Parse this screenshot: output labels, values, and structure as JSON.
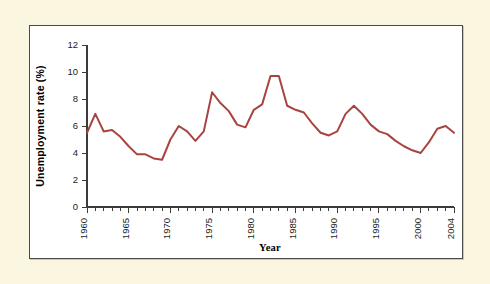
{
  "figure": {
    "background_color": "#fbf6e0",
    "panel_color": "#ffffff",
    "border_color": "#4a4a46"
  },
  "chart_data": {
    "type": "line",
    "title": "",
    "xlabel": "Year",
    "ylabel": "Unemployment rate (%)",
    "xlim": [
      1960,
      2004
    ],
    "ylim": [
      0,
      12
    ],
    "grid": false,
    "legend": "none",
    "line_color": "#a8443f",
    "xticks": [
      1960,
      1965,
      1970,
      1975,
      1980,
      1985,
      1990,
      1995,
      2000,
      2004
    ],
    "xtick_labels": [
      "1960",
      "1965",
      "1970",
      "1975",
      "1980",
      "1985",
      "1990",
      "1995",
      "2000",
      "2004"
    ],
    "xtick_minor": [
      1961,
      1962,
      1963,
      1964,
      1966,
      1967,
      1968,
      1969,
      1971,
      1972,
      1973,
      1974,
      1976,
      1977,
      1978,
      1979,
      1981,
      1982,
      1983,
      1984,
      1986,
      1987,
      1988,
      1989,
      1991,
      1992,
      1993,
      1994,
      1996,
      1997,
      1998,
      1999,
      2001,
      2002,
      2003
    ],
    "yticks": [
      0,
      2,
      4,
      6,
      8,
      10,
      12
    ],
    "ytick_labels": [
      "0",
      "2",
      "4",
      "6",
      "8",
      "10",
      "12"
    ],
    "x": [
      1960,
      1961,
      1962,
      1963,
      1964,
      1965,
      1966,
      1967,
      1968,
      1969,
      1970,
      1971,
      1972,
      1973,
      1974,
      1975,
      1976,
      1977,
      1978,
      1979,
      1980,
      1981,
      1982,
      1983,
      1984,
      1985,
      1986,
      1987,
      1988,
      1989,
      1990,
      1991,
      1992,
      1993,
      1994,
      1995,
      1996,
      1997,
      1998,
      1999,
      2000,
      2001,
      2002,
      2003,
      2004
    ],
    "values": [
      5.5,
      6.9,
      5.6,
      5.7,
      5.2,
      4.5,
      3.9,
      3.9,
      3.6,
      3.5,
      5.0,
      6.0,
      5.6,
      4.9,
      5.6,
      8.5,
      7.7,
      7.1,
      6.1,
      5.9,
      7.2,
      7.6,
      9.7,
      9.7,
      7.5,
      7.2,
      7.0,
      6.2,
      5.5,
      5.3,
      5.6,
      6.9,
      7.5,
      6.9,
      6.1,
      5.6,
      5.4,
      4.9,
      4.5,
      4.2,
      4.0,
      4.8,
      5.8,
      6.0,
      5.5
    ]
  }
}
